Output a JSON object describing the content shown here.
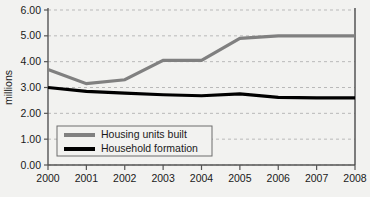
{
  "chart_data": {
    "type": "line",
    "title": "",
    "xlabel": "",
    "ylabel": "millions",
    "categories": [
      "2000",
      "2001",
      "2002",
      "2003",
      "2004",
      "2005",
      "2006",
      "2007",
      "2008"
    ],
    "ylim": [
      0,
      6
    ],
    "ytick_step": 1,
    "ytick_labels": [
      "0.00",
      "1.00",
      "2.00",
      "3.00",
      "4.00",
      "5.00",
      "6.00"
    ],
    "grid": true,
    "grid_axis": "y",
    "legend_position": "inside-lower-left",
    "series": [
      {
        "name": "Housing units built",
        "color": "#808080",
        "values": [
          3.7,
          3.15,
          3.3,
          4.05,
          4.05,
          4.9,
          5.0,
          5.0,
          5.0
        ]
      },
      {
        "name": "Household formation",
        "color": "#000000",
        "values": [
          3.0,
          2.85,
          2.78,
          2.72,
          2.68,
          2.75,
          2.62,
          2.6,
          2.6
        ]
      }
    ]
  },
  "axis": {
    "y_title": "millions",
    "y_ticks": [
      "6.00",
      "5.00",
      "4.00",
      "3.00",
      "2.00",
      "1.00",
      "0.00"
    ],
    "x_ticks": [
      "2000",
      "2001",
      "2002",
      "2003",
      "2004",
      "2005",
      "2006",
      "2007",
      "2008"
    ]
  },
  "legend": {
    "items": [
      {
        "label": "Housing units built",
        "color": "#808080"
      },
      {
        "label": "Household formation",
        "color": "#000000"
      }
    ]
  },
  "colors": {
    "background": "#f2f2f0",
    "axis": "#555555",
    "grid": "#b9b9b9",
    "series_gray": "#808080",
    "series_black": "#000000"
  }
}
